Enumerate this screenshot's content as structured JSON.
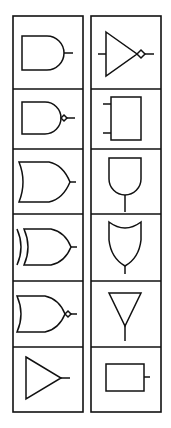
{
  "palette": {
    "stroke_color": "#111111",
    "background_color": "#ffffff",
    "columns": [
      {
        "name": "left",
        "cells": [
          {
            "gate": "and-gate"
          },
          {
            "gate": "nand-gate"
          },
          {
            "gate": "or-gate"
          },
          {
            "gate": "xor-gate"
          },
          {
            "gate": "nor-gate"
          },
          {
            "gate": "buffer-gate"
          }
        ]
      },
      {
        "name": "right",
        "cells": [
          {
            "gate": "not-gate"
          },
          {
            "gate": "block-two-input"
          },
          {
            "gate": "and-gate-vertical"
          },
          {
            "gate": "or-gate-vertical"
          },
          {
            "gate": "buffer-gate-vertical"
          },
          {
            "gate": "block-one-output"
          }
        ]
      }
    ],
    "row_edges": [
      16,
      89,
      149,
      214,
      281,
      347,
      412
    ],
    "column_edges": {
      "left": [
        13,
        83
      ],
      "right": [
        91,
        161
      ]
    }
  }
}
